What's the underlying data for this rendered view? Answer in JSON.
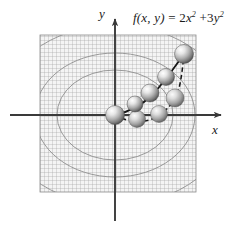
{
  "figure": {
    "title_formula": {
      "fn": "f",
      "args": "(x, y)",
      "equals": "=",
      "term1_coef": "2",
      "term1_var": "x",
      "term1_exp": "2",
      "plus": "+",
      "term2_coef": "3",
      "term2_var": "y",
      "term2_exp": "2",
      "plain": "f(x, y) = 2x^2 + 3y^2"
    },
    "axes": {
      "y_label": "y",
      "x_label": "x",
      "origin": {
        "x": 115,
        "y": 115
      },
      "x_axis": {
        "x1": 10,
        "x2": 227,
        "y": 115
      },
      "y_axis": {
        "x": 115,
        "y1": 14,
        "y2": 221
      }
    },
    "colors": {
      "background": "#ffffff",
      "axis": "#3a3a3a",
      "grid_line": "#8c8c8c",
      "grid_fill": "#f2f2f2",
      "contour": "#9a9a9a",
      "band_light": "#ececec",
      "band_mid": "#e2e2e2",
      "path": "#1a1a1a",
      "sphere_highlight": "#ffffff",
      "sphere_mid": "#b4b4b4",
      "sphere_shadow": "#4a4a4a",
      "text": "#1a1a1a"
    },
    "grid": {
      "left": 40,
      "top": 35,
      "width": 156,
      "height": 157,
      "cell": 4
    },
    "contours": [
      {
        "cx": 115,
        "cy": 115,
        "rx": 80,
        "ry": 62
      },
      {
        "cx": 115,
        "cy": 115,
        "rx": 58,
        "ry": 45
      },
      {
        "cx": 115,
        "cy": 115,
        "rx": 116,
        "ry": 90
      },
      {
        "cx": 115,
        "cy": 115,
        "rx": 150,
        "ry": 116
      }
    ],
    "spheres": [
      {
        "id": "s0",
        "cx": 115,
        "cy": 115,
        "r": 9.5,
        "path": "both",
        "order": 0
      },
      {
        "id": "s1",
        "cx": 135,
        "cy": 104,
        "r": 8.0,
        "path": "upper",
        "order": 1
      },
      {
        "id": "s2",
        "cx": 150,
        "cy": 93,
        "r": 9.0,
        "path": "upper",
        "order": 2
      },
      {
        "id": "s3",
        "cx": 166,
        "cy": 77,
        "r": 8.5,
        "path": "upper",
        "order": 3
      },
      {
        "id": "s4",
        "cx": 184,
        "cy": 54,
        "r": 9.5,
        "path": "upper",
        "order": 4
      },
      {
        "id": "s5",
        "cx": 137,
        "cy": 119,
        "r": 8.5,
        "path": "lower",
        "order": 1
      },
      {
        "id": "s6",
        "cx": 159,
        "cy": 114,
        "r": 8.5,
        "path": "lower",
        "order": 2
      },
      {
        "id": "s7",
        "cx": 175,
        "cy": 98,
        "r": 9.0,
        "path": "lower",
        "order": 3
      }
    ],
    "paths": {
      "upper": {
        "style": "solid",
        "d": "M 115 115 C 128 112 141 106 152 95 C 163 84 174 68 184 54"
      },
      "lower": {
        "style": "dashed",
        "d": "M 115 115 C 124 120 132 122 143 121 C 156 120 166 112 175 99 C 180 90 182 74 184 54"
      }
    }
  }
}
